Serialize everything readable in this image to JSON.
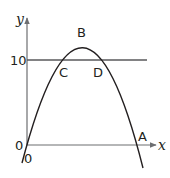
{
  "diagram": {
    "type": "parabola-graph",
    "axes": {
      "x_label": "x",
      "y_label": "y",
      "origin_label_left": "0",
      "origin_label_below": "0"
    },
    "horizontal_line": {
      "value_label": "10"
    },
    "points": {
      "A": "A",
      "B": "B",
      "C": "C",
      "D": "D"
    },
    "colors": {
      "curve": "#231f20",
      "axis": "#6d6e71",
      "line": "#58595b"
    }
  }
}
